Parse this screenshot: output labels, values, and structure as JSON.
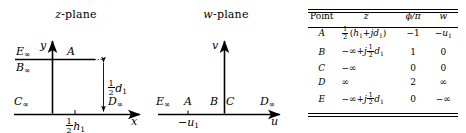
{
  "figure": {
    "panels": [
      {
        "id": "z-plane",
        "title": "z-plane",
        "title_var": "z",
        "title_suffix": "-plane",
        "axes": {
          "x_label": "x",
          "y_label": "y"
        },
        "labels": [
          {
            "name": "E-infinity",
            "text": "E∞"
          },
          {
            "name": "B-infinity",
            "text": "B∞"
          },
          {
            "name": "A-point",
            "text": "A"
          },
          {
            "name": "C-infinity",
            "text": "C∞"
          },
          {
            "name": "D-infinity",
            "text": "D∞"
          }
        ],
        "dimensions": [
          {
            "name": "half-d1",
            "numerator": "1",
            "denominator": "2",
            "symbol": "d",
            "subscript": "1"
          },
          {
            "name": "half-h1",
            "numerator": "1",
            "denominator": "2",
            "symbol": "h",
            "subscript": "1"
          }
        ]
      },
      {
        "id": "w-plane",
        "title": "w-plane",
        "title_var": "w",
        "title_suffix": "-plane",
        "axes": {
          "x_label": "u",
          "y_label": "v"
        },
        "labels": [
          {
            "name": "E-infinity",
            "text": "E∞"
          },
          {
            "name": "A-point",
            "text": "A"
          },
          {
            "name": "B-point",
            "text": "B"
          },
          {
            "name": "C-point",
            "text": "C"
          },
          {
            "name": "D-infinity",
            "text": "D∞"
          },
          {
            "name": "minus-u1",
            "text": "−u",
            "subscript": "1"
          }
        ]
      }
    ]
  },
  "table": {
    "headers": [
      "Point",
      "z",
      "ϕ/π",
      "w"
    ],
    "rows": [
      {
        "point": "A",
        "z_parts": {
          "frac_num": "1",
          "frac_den": "2",
          "expr": "(h₁+jd₁)"
        },
        "z_text": "½ (h₁+jd₁)",
        "phi": "−1",
        "w": "−u₁"
      },
      {
        "point": "B",
        "z_parts": {
          "prefix": "−∞ + j",
          "frac_num": "1",
          "frac_den": "2",
          "expr": "d₁"
        },
        "z_text": "−∞ + j½ d₁",
        "phi": "1",
        "w": "0"
      },
      {
        "point": "C",
        "z_parts": {
          "prefix": "−∞"
        },
        "z_text": "−∞",
        "phi": "0",
        "w": "0"
      },
      {
        "point": "D",
        "z_parts": {
          "prefix": "∞"
        },
        "z_text": "∞",
        "phi": "2",
        "w": "∞"
      },
      {
        "point": "E",
        "z_parts": {
          "prefix": "−∞ + j",
          "frac_num": "1",
          "frac_den": "2",
          "expr": "d₁"
        },
        "z_text": "−∞ + j½ d₁",
        "phi": "0",
        "w": "−∞"
      }
    ]
  },
  "colors": {
    "ink": "#000000",
    "background": "#ffffff"
  }
}
